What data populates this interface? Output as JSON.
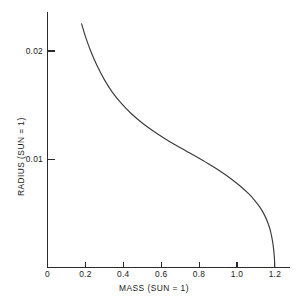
{
  "chart_data": {
    "type": "line",
    "title": "",
    "xlabel": "MASS (SUN = 1)",
    "ylabel": "RADIUS (SUN = 1)",
    "xlim": [
      0,
      1.28
    ],
    "ylim": [
      0,
      0.0236
    ],
    "grid": false,
    "legend": null,
    "xticks": [
      {
        "value": 0,
        "label": "0"
      },
      {
        "value": 0.2,
        "label": "0.2"
      },
      {
        "value": 0.4,
        "label": "0.4"
      },
      {
        "value": 0.6,
        "label": "0.6"
      },
      {
        "value": 0.8,
        "label": "0.8"
      },
      {
        "value": 1.0,
        "label": "1.0"
      },
      {
        "value": 1.2,
        "label": "1.2"
      }
    ],
    "yticks": [
      {
        "value": 0.01,
        "label": "0.01"
      },
      {
        "value": 0.02,
        "label": "0.02"
      }
    ],
    "series": [
      {
        "name": "mass-radius relation",
        "color": "#3a3a3a",
        "x": [
          0.18,
          0.2,
          0.23,
          0.26,
          0.3,
          0.34,
          0.39,
          0.44,
          0.5,
          0.56,
          0.62,
          0.68,
          0.74,
          0.8,
          0.86,
          0.92,
          0.97,
          1.02,
          1.06,
          1.09,
          1.12,
          1.145,
          1.165,
          1.178,
          1.188,
          1.194,
          1.198,
          1.2
        ],
        "y": [
          0.0225,
          0.02135,
          0.0199,
          0.0187,
          0.01735,
          0.01625,
          0.01515,
          0.01425,
          0.01335,
          0.01258,
          0.0119,
          0.01128,
          0.01068,
          0.01008,
          0.00946,
          0.0088,
          0.00818,
          0.00748,
          0.00684,
          0.00628,
          0.0056,
          0.00486,
          0.00404,
          0.0033,
          0.00242,
          0.00163,
          0.00078,
          0.0
        ]
      }
    ]
  },
  "caption": {
    "text": ""
  }
}
